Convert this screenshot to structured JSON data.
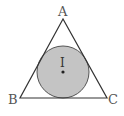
{
  "diagram": {
    "vertices": [
      {
        "label": "A",
        "x": 63,
        "y": 19
      },
      {
        "label": "B",
        "x": 20,
        "y": 98
      },
      {
        "label": "C",
        "x": 107,
        "y": 98
      }
    ],
    "incircle": {
      "label": "I",
      "cx": 63,
      "cy": 72,
      "r": 26,
      "fill": "#c4c4c4",
      "stroke": "#555555"
    },
    "colors": {
      "line": "#333333",
      "background": "#ffffff"
    }
  }
}
